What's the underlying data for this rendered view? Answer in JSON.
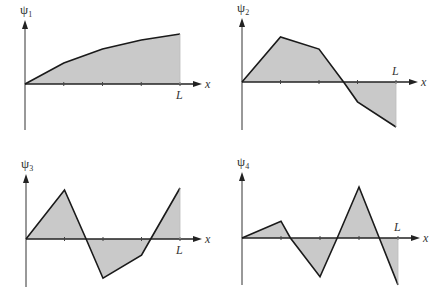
{
  "chart_data": [
    {
      "type": "line",
      "title": "ψ1",
      "ylabel": "ψ1",
      "xlabel": "x",
      "x_end_label": "L",
      "x": [
        0,
        0.25,
        0.5,
        0.75,
        1.0
      ],
      "y": [
        0,
        0.42,
        0.7,
        0.88,
        1.0
      ],
      "filled": true,
      "grid": false,
      "legend": null
    },
    {
      "type": "line",
      "title": "ψ2",
      "ylabel": "ψ2",
      "xlabel": "x",
      "x_end_label": "L",
      "x": [
        0,
        0.25,
        0.5,
        0.66,
        0.75,
        1.0
      ],
      "y": [
        0,
        1.0,
        0.73,
        0,
        -0.44,
        -1.0
      ],
      "filled": true,
      "grid": false,
      "legend": null
    },
    {
      "type": "line",
      "title": "ψ3",
      "ylabel": "ψ3",
      "xlabel": "x",
      "x_end_label": "L",
      "x": [
        0,
        0.25,
        0.39,
        0.5,
        0.75,
        0.81,
        1.0
      ],
      "y": [
        0,
        1.0,
        0,
        -0.8,
        -0.33,
        0,
        1.04
      ],
      "filled": true,
      "grid": false,
      "legend": null
    },
    {
      "type": "line",
      "title": "ψ4",
      "ylabel": "ψ4",
      "xlabel": "x",
      "x_end_label": "L",
      "x": [
        0,
        0.25,
        0.31,
        0.5,
        0.61,
        0.75,
        0.88,
        1.0
      ],
      "y": [
        0,
        0.33,
        0,
        -0.76,
        0,
        1.0,
        0,
        -0.92
      ],
      "filled": true,
      "grid": false,
      "legend": null
    }
  ],
  "panels": [
    {
      "psi": "ψ",
      "sub": "1",
      "xlabel": "x",
      "L": "L",
      "L_pos": "below",
      "ox": 25,
      "oy": 84,
      "w": 155,
      "amp": 50,
      "ytop": 20,
      "ybot": 130
    },
    {
      "psi": "ψ",
      "sub": "2",
      "xlabel": "x",
      "L": "L",
      "L_pos": "above",
      "ox": 242,
      "oy": 82,
      "w": 154,
      "amp": 45,
      "ytop": 18,
      "ybot": 130
    },
    {
      "psi": "ψ",
      "sub": "3",
      "xlabel": "x",
      "L": "L",
      "L_pos": "below",
      "ox": 26,
      "oy": 239,
      "w": 154,
      "amp": 49,
      "ytop": 174,
      "ybot": 287
    },
    {
      "psi": "ψ",
      "sub": "4",
      "xlabel": "x",
      "L": "L",
      "L_pos": "above",
      "ox": 242,
      "oy": 238,
      "w": 156,
      "amp": 51,
      "ytop": 172,
      "ybot": 285
    }
  ],
  "colors": {
    "fill": "#c9c9c9",
    "line": "#1a1a1a",
    "axis": "#333333"
  }
}
